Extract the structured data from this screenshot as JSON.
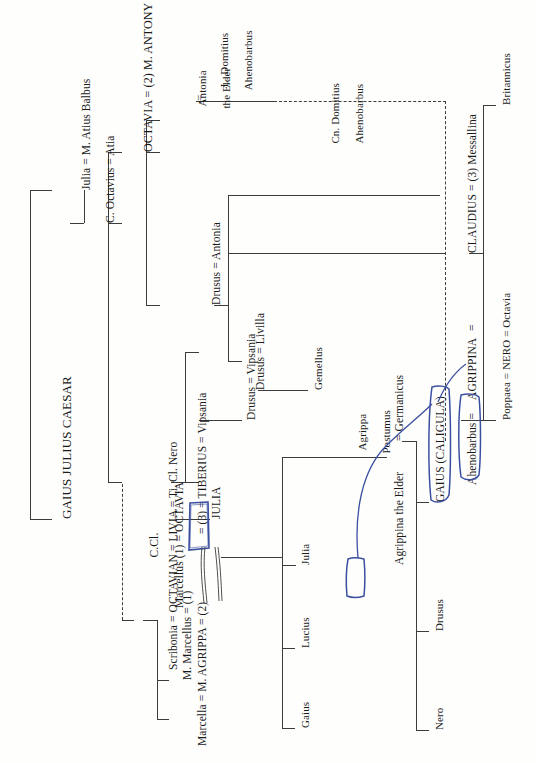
{
  "document": {
    "title": "Julio-Claudian Family Tree",
    "orientation": "rotated-90-ccw",
    "ink_color": "#3a4fa0",
    "line_color": "#3c3c3c"
  },
  "nodes": {
    "caesar": "GAIUS JULIUS CAESAR",
    "julia_balbus": "Julia = M. Atius Balbus",
    "octavius_atia": "C. Octavius = Atia",
    "octavia_antony": "OCTAVIA = (2) M. ANTONY",
    "antonia_elder_line1": "Antonia",
    "antonia_elder_line2": "the Elder",
    "antonia_elder_eq": "=",
    "domitius_line1": "L. Domitius",
    "domitius_line2": "Ahenobarbus",
    "cn_domitius_line1": "Cn. Domitius",
    "cn_domitius_line2": "Ahenobarbus",
    "britannicus": "Britannicus",
    "claudius_messallina": "CLAUDIUS = (3) Messallina",
    "agrippina_claudius_eq": "=",
    "agrippina": "AGRIPPINA",
    "ahenobarbus_eq": "Ahenobarbus =",
    "octavia_nero": "Poppaea = NERO = Octavia",
    "drusus_antonia": "Drusus = Antonia",
    "drusus_livilla": "Drusus = Livilla",
    "gemellus": "Gemellus",
    "drusus_vipsania": "Drusus = Vipsania",
    "tiberius": "= (3) = TIBERIUS = Vipsania",
    "tiberius_short": "= (3) = TIBERIUS",
    "scribonia_octavian_livia": "Scribonia = OCTAVIAN = LIVIA = Ti. Cl. Nero",
    "julia_box": "JULIA",
    "ccl_line1": "C.Cl.",
    "ccl_line2": "Marcellus (1) = OCTAVIA",
    "m_marcellus": "M. Marcellus = (1)",
    "marcella_agrippa": "Marcella = M. AGRIPPA = (2)",
    "gaius": "Gaius",
    "lucius": "Lucius",
    "julia_child": "Julia",
    "agrippa_postumus_line1": "Agrippa",
    "agrippa_postumus_line2": "Postumus",
    "agrippina_elder": "Agrippina the Elder",
    "germanicus_eq": "= Germanicus",
    "nero": "Nero",
    "drusus": "Drusus",
    "caligula": "GAIUS (CALIGULA)"
  },
  "annotations": {
    "circled_julia_parent": "JULIA",
    "circled_julia_child": "Julia",
    "circled_agrippina_elder": "Agrippina the Elder",
    "circled_agrippina": "AGRIPPINA",
    "connector_note": "hand-drawn blue link from Julia to Agrippina the Elder, and from Agrippina the Elder to AGRIPPINA"
  }
}
